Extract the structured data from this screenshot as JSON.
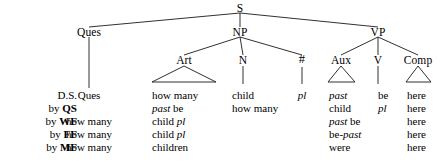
{
  "figure": {
    "type": "syntax-derivation-tree",
    "tree": {
      "root": {
        "label": "S"
      },
      "level2": [
        {
          "label": "Ques"
        },
        {
          "label": "NP"
        },
        {
          "label": "VP"
        }
      ],
      "level3": [
        {
          "label": "Art"
        },
        {
          "label": "N"
        },
        {
          "label": "#"
        },
        {
          "label": "Aux"
        },
        {
          "label": "V"
        },
        {
          "label": "Comp"
        }
      ]
    },
    "row_labels": [
      {
        "prefix": "",
        "name": "D.S."
      },
      {
        "prefix": "by",
        "name": "QS"
      },
      {
        "prefix": "by",
        "name": "WF"
      },
      {
        "prefix": "by",
        "name": "FF"
      },
      {
        "prefix": "by",
        "name": "MF"
      }
    ],
    "columns": [
      {
        "head": "Ques",
        "key": "ques"
      },
      {
        "head": "Art",
        "key": "art"
      },
      {
        "head": "N",
        "key": "n"
      },
      {
        "head": "#",
        "key": "hash"
      },
      {
        "head": "Aux",
        "key": "aux"
      },
      {
        "head": "V",
        "key": "v"
      },
      {
        "head": "Comp",
        "key": "comp"
      }
    ],
    "rows": [
      {
        "label": "D.S.",
        "ques": [
          {
            "t": "Ques",
            "i": false
          }
        ],
        "art": [
          {
            "t": "how many",
            "i": false
          }
        ],
        "n": [
          {
            "t": "child",
            "i": false
          }
        ],
        "hash": [
          {
            "t": "pl",
            "i": true
          }
        ],
        "aux": [
          {
            "t": "past",
            "i": true
          }
        ],
        "v": [
          {
            "t": "be",
            "i": false
          }
        ],
        "comp": [
          {
            "t": "here",
            "i": false
          }
        ]
      },
      {
        "label": "by QS",
        "ques": [],
        "art": [
          {
            "t": "past",
            "i": true
          },
          {
            "t": " be",
            "i": false
          }
        ],
        "n": [
          {
            "t": "how many",
            "i": false
          }
        ],
        "hash": [],
        "aux": [
          {
            "t": "child",
            "i": false
          }
        ],
        "v": [
          {
            "t": "pl",
            "i": true
          }
        ],
        "comp": [
          {
            "t": "here",
            "i": false
          }
        ]
      },
      {
        "label": "by WF",
        "ques": [
          {
            "t": "how many",
            "i": false
          }
        ],
        "art": [
          {
            "t": "child ",
            "i": false
          },
          {
            "t": "pl",
            "i": true
          }
        ],
        "n": [],
        "hash": [],
        "aux": [
          {
            "t": "past",
            "i": true
          },
          {
            "t": " be",
            "i": false
          }
        ],
        "v": [],
        "comp": [
          {
            "t": "here",
            "i": false
          }
        ]
      },
      {
        "label": "by FF",
        "ques": [
          {
            "t": "how many",
            "i": false
          }
        ],
        "art": [
          {
            "t": "child ",
            "i": false
          },
          {
            "t": "pl",
            "i": true
          }
        ],
        "n": [],
        "hash": [],
        "aux": [
          {
            "t": "be-",
            "i": false
          },
          {
            "t": "past",
            "i": true
          }
        ],
        "v": [],
        "comp": [
          {
            "t": "here",
            "i": false
          }
        ]
      },
      {
        "label": "by MF",
        "ques": [
          {
            "t": "how many",
            "i": false
          }
        ],
        "art": [
          {
            "t": "children",
            "i": false
          }
        ],
        "n": [],
        "hash": [],
        "aux": [
          {
            "t": "were",
            "i": false
          }
        ],
        "v": [],
        "comp": [
          {
            "t": "here",
            "i": false
          }
        ]
      }
    ],
    "colors": {
      "ink": "#000000",
      "background": "#ffffff"
    }
  }
}
